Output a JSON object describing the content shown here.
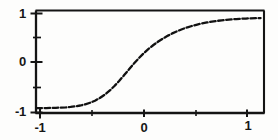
{
  "chart_data": {
    "type": "line",
    "title": "",
    "subtitle": "",
    "xlabel": "",
    "ylabel": "",
    "xlim": [
      -1.15,
      1.18
    ],
    "ylim": [
      -1.08,
      1.08
    ],
    "grid": false,
    "legend": null,
    "line_style": "dashed",
    "line_color": "#111111",
    "x_ticks": [
      -1,
      0,
      1
    ],
    "x_tick_labels": [
      "-1",
      "0",
      "1"
    ],
    "x_minor_ticks": [
      -0.5,
      0.5
    ],
    "y_ticks": [
      -1,
      0,
      1
    ],
    "y_tick_labels": [
      "1",
      "0",
      "-1"
    ],
    "y_minor_ticks": [
      -0.5,
      0.5
    ],
    "series": [
      {
        "name": "sigmoid",
        "x": [
          -1.15,
          -1.1,
          -1.05,
          -1.0,
          -0.95,
          -0.9,
          -0.85,
          -0.8,
          -0.75,
          -0.7,
          -0.65,
          -0.6,
          -0.55,
          -0.5,
          -0.45,
          -0.4,
          -0.35,
          -0.3,
          -0.25,
          -0.2,
          -0.15,
          -0.1,
          -0.05,
          0.0,
          0.05,
          0.1,
          0.15,
          0.2,
          0.25,
          0.3,
          0.35,
          0.4,
          0.45,
          0.5,
          0.55,
          0.6,
          0.65,
          0.7,
          0.75,
          0.8,
          0.85,
          0.9,
          0.95,
          1.0,
          1.05,
          1.1,
          1.15
        ],
        "y": [
          -0.985,
          -0.985,
          -0.983,
          -0.981,
          -0.978,
          -0.974,
          -0.968,
          -0.959,
          -0.946,
          -0.928,
          -0.903,
          -0.869,
          -0.824,
          -0.766,
          -0.694,
          -0.607,
          -0.505,
          -0.391,
          -0.268,
          -0.142,
          -0.018,
          0.098,
          0.205,
          0.3,
          0.385,
          0.461,
          0.529,
          0.589,
          0.643,
          0.691,
          0.733,
          0.77,
          0.802,
          0.83,
          0.854,
          0.875,
          0.893,
          0.908,
          0.921,
          0.932,
          0.941,
          0.948,
          0.955,
          0.96,
          0.964,
          0.967,
          0.969
        ]
      }
    ]
  },
  "axes": {
    "y_labels": [
      {
        "text": "1",
        "value": 1
      },
      {
        "text": "0",
        "value": 0
      },
      {
        "text": "-1",
        "value": -1
      }
    ],
    "x_labels": [
      {
        "text": "-1",
        "value": -1
      },
      {
        "text": "0",
        "value": 0
      },
      {
        "text": "1",
        "value": 1
      }
    ]
  }
}
